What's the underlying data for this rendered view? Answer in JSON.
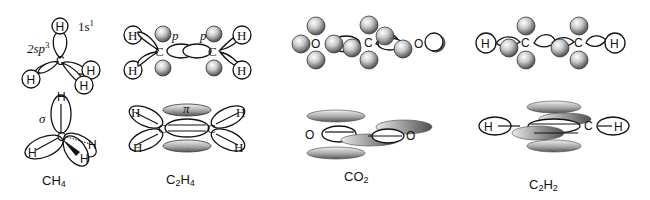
{
  "figure": {
    "colors": {
      "stroke": "#111111",
      "lobe_fill": "#ffffff",
      "p_orbital_light": "#f2f2f2",
      "p_orbital_dark": "#5a5a5a"
    }
  },
  "molecules": [
    {
      "id": "ch4",
      "caption_main": "CH",
      "caption_sub": "4",
      "labels": {
        "s_orbital": "1s",
        "s_orbital_sup": "1",
        "hybrid": "2sp",
        "hybrid_sup": "3",
        "sigma": "σ",
        "carbon": "C",
        "hydrogen": "H"
      }
    },
    {
      "id": "c2h4",
      "caption_main": "C",
      "caption_sub1": "2",
      "caption_mid": "H",
      "caption_sub2": "4",
      "labels": {
        "p_left": "p",
        "p_right": "p",
        "pi": "π",
        "carbon": "C",
        "hydrogen": "H"
      }
    },
    {
      "id": "co2",
      "caption_main": "CO",
      "caption_sub": "2",
      "labels": {
        "carbon": "C",
        "oxygen": "O"
      }
    },
    {
      "id": "c2h2",
      "caption_main": "C",
      "caption_sub1": "2",
      "caption_mid": "H",
      "caption_sub2": "2",
      "labels": {
        "carbon": "C",
        "hydrogen": "H"
      }
    }
  ]
}
